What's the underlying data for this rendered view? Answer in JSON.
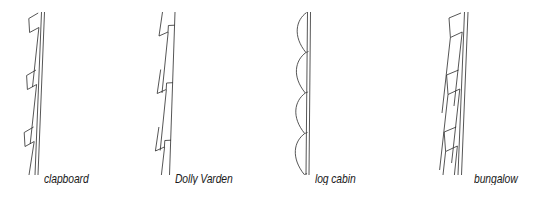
{
  "figure": {
    "background_color": "#ffffff",
    "line_color": "#2b2b2b",
    "panels": [
      {
        "id": "clapboard",
        "caption": "clapboard",
        "profile_type": "overlapping tapered boards",
        "board_count": 3,
        "wall_tilt": "slight lean to the right"
      },
      {
        "id": "dolly-varden",
        "caption": "Dolly Varden",
        "profile_type": "rabbeted bevel boards with stepped notch",
        "board_count": 3,
        "wall_tilt": "slight lean to the right"
      },
      {
        "id": "log-cabin",
        "caption": "log cabin",
        "profile_type": "convex rounded half-log faces",
        "board_count": 4,
        "wall_tilt": "near vertical"
      },
      {
        "id": "bungalow",
        "caption": "bungalow",
        "profile_type": "thick overlapping wide boards",
        "board_count": 3,
        "wall_tilt": "slight lean to the right"
      }
    ]
  }
}
